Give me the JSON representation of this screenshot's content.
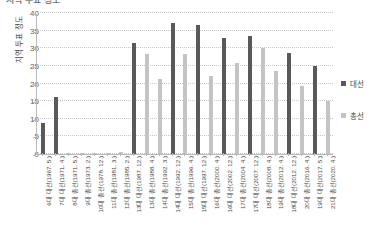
{
  "chart_data": {
    "type": "bar",
    "title": "지역 투표 정도",
    "xlabel": "",
    "ylabel": "지역 투표 정도",
    "ylim": [
      0,
      40
    ],
    "yticks": [
      0,
      5,
      10,
      15,
      20,
      25,
      30,
      35,
      40
    ],
    "grid": true,
    "legend_position": "right",
    "categories": [
      "6대 대선(1967. 5.)",
      "7대 대선(1971. 4.)",
      "8대 총선(1971. 5.)",
      "9대 총선(1973. 2.)",
      "10대 총선(1978. 12.)",
      "11대 총선(1981. 3.)",
      "12대 총선(1985. 2.)",
      "13대 대선(1987. 12.)",
      "13대 총선(1988. 4.)",
      "14대 총선(1992. 3.)",
      "14대 대선(1992. 12.)",
      "15대 총선(1996. 4.)",
      "15대 대선(1997. 12.)",
      "16대 총선(2000. 4.)",
      "16대 대선(2002. 12.)",
      "17대 총선(2004. 4.)",
      "17대 대선(2007. 12.)",
      "18대 총선(2008. 4.)",
      "19대 총선(2012. 4.)",
      "18대 대선(2012. 12.)",
      "20대 총선(2016. 4.)",
      "19대 대선(2017. 5.)",
      "21대 총선(2020. 4.)"
    ],
    "series": [
      {
        "name": "대선",
        "color": "#595959",
        "values": [
          8.8,
          16.2,
          null,
          null,
          null,
          null,
          null,
          31.5,
          null,
          null,
          37.2,
          null,
          36.5,
          null,
          33.0,
          null,
          33.5,
          null,
          null,
          28.7,
          null,
          25.1,
          null
        ]
      },
      {
        "name": "총선",
        "color": "#c4c4c4",
        "values": [
          null,
          null,
          0.4,
          0.0,
          0.0,
          0.4,
          0.5,
          null,
          28.4,
          21.3,
          null,
          28.4,
          null,
          22.0,
          null,
          25.9,
          null,
          30.2,
          23.6,
          null,
          19.3,
          null,
          15.1
        ]
      }
    ]
  },
  "legend": {
    "items": [
      {
        "label": "대선",
        "color": "#595959"
      },
      {
        "label": "총선",
        "color": "#c4c4c4"
      }
    ]
  }
}
